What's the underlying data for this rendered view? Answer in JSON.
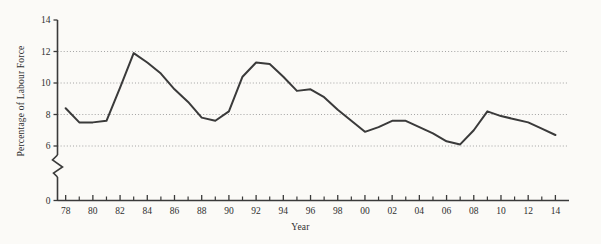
{
  "chart_data": {
    "type": "line",
    "title": "",
    "xlabel": "Year",
    "ylabel": "Percentage of Labour Force",
    "xlim": [
      1977.4,
      2015.0
    ],
    "ylim": [
      5.2,
      14.0
    ],
    "y_axis_break": true,
    "y_break_from": 0,
    "y_break_to": 5.2,
    "yticks": [
      0,
      6,
      8,
      10,
      12,
      14
    ],
    "ytick_labels": [
      "0",
      "6",
      "8",
      "10",
      "12",
      "14"
    ],
    "gridlines": [
      6,
      8,
      10,
      12
    ],
    "grid": "horizontal-dotted",
    "legend": "none",
    "xticks_major": [
      1978,
      1980,
      1982,
      1984,
      1986,
      1988,
      1990,
      1992,
      1994,
      1996,
      1998,
      2000,
      2002,
      2004,
      2006,
      2008,
      2010,
      2012,
      2014
    ],
    "xtick_labels": [
      "78",
      "80",
      "82",
      "84",
      "86",
      "88",
      "90",
      "92",
      "94",
      "96",
      "98",
      "00",
      "02",
      "04",
      "06",
      "08",
      "10",
      "12",
      "14"
    ],
    "xticks_minor": [
      1979,
      1981,
      1983,
      1985,
      1987,
      1989,
      1991,
      1993,
      1995,
      1997,
      1999,
      2001,
      2003,
      2005,
      2007,
      2009,
      2011,
      2013
    ],
    "line_color": "#3a3a3a",
    "line_width": 2.0,
    "background": "#fbfaf7",
    "x": [
      1978,
      1979,
      1980,
      1981,
      1982,
      1983,
      1984,
      1985,
      1986,
      1987,
      1988,
      1989,
      1990,
      1991,
      1992,
      1993,
      1994,
      1995,
      1996,
      1997,
      1998,
      1999,
      2000,
      2001,
      2002,
      2003,
      2004,
      2005,
      2006,
      2007,
      2008,
      2009,
      2010,
      2011,
      2012,
      2013,
      2014
    ],
    "values": [
      8.4,
      7.5,
      7.5,
      7.6,
      9.7,
      11.9,
      11.3,
      10.6,
      9.6,
      8.8,
      7.8,
      7.6,
      8.2,
      10.4,
      11.3,
      11.2,
      10.4,
      9.5,
      9.6,
      9.1,
      8.3,
      7.6,
      6.9,
      7.2,
      7.6,
      7.6,
      7.2,
      6.8,
      6.3,
      6.1,
      7.0,
      8.2,
      7.9,
      7.7,
      7.5,
      7.1,
      6.7
    ]
  },
  "axis": {
    "ylabel": "Percentage of Labour Force",
    "xlabel": "Year"
  }
}
